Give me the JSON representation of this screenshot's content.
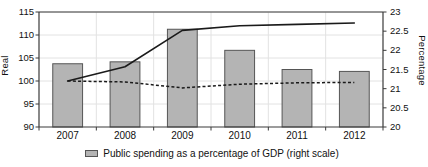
{
  "chart_data": {
    "type": "bar",
    "title": "",
    "subtitle": "",
    "categories": [
      "2007",
      "2008",
      "2009",
      "2010",
      "2011",
      "2012"
    ],
    "xlabel": "",
    "ylabel": "Real",
    "ylabel_right": "Percentage",
    "ylim": [
      90,
      115
    ],
    "ylim_right": [
      20,
      23
    ],
    "yticks": [
      "90",
      "95",
      "100",
      "105",
      "110",
      "115"
    ],
    "ytick_values": [
      90,
      95,
      100,
      105,
      110,
      115
    ],
    "yticks_right": [
      "20",
      "20.5",
      "21",
      "21.5",
      "22",
      "22.5",
      "23"
    ],
    "ytick_values_right": [
      20,
      20.5,
      21,
      21.5,
      22,
      22.5,
      23
    ],
    "grid": true,
    "legend_position": "bottom-center",
    "series": [
      {
        "name": "Public spending as a percentage of GDP (right scale)",
        "type": "bar",
        "axis": "right",
        "values": [
          21.65,
          21.7,
          22.55,
          22.0,
          21.5,
          21.45
        ],
        "fill_color": "#b4b4b4",
        "edge_color": "#555555"
      },
      {
        "name": "solid-line-series",
        "type": "line",
        "axis": "left",
        "style": "solid",
        "values": [
          100.0,
          103.1,
          111.0,
          112.0,
          112.3,
          112.6
        ],
        "color": "#1a1a1a"
      },
      {
        "name": "dashed-line-series",
        "type": "line",
        "axis": "left",
        "style": "dashed",
        "values": [
          100.0,
          99.8,
          98.5,
          99.3,
          99.6,
          99.7
        ],
        "color": "#1a1a1a"
      }
    ]
  },
  "legend": {
    "entries": [
      {
        "label": "Public spending as a percentage of GDP (right scale)",
        "marker": "bar-swatch",
        "color": "#b4b4b4"
      }
    ]
  },
  "axes": {
    "left_title": "Real",
    "right_title": "Percentage"
  }
}
